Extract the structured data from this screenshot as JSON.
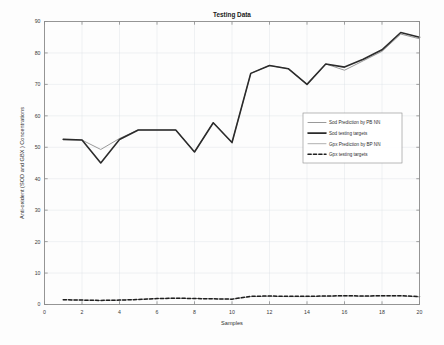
{
  "chart_data": {
    "type": "line",
    "title": "Testing Data",
    "xlabel": "Samples",
    "ylabel": "Anti-oxident (SOD and GBX ) Concentrations",
    "xlim": [
      0,
      20
    ],
    "ylim": [
      0,
      90
    ],
    "xticks": [
      0,
      2,
      4,
      6,
      8,
      10,
      12,
      14,
      16,
      18,
      20
    ],
    "yticks": [
      0,
      10,
      20,
      30,
      40,
      50,
      60,
      70,
      80,
      90
    ],
    "grid": true,
    "legend_position": "center-right",
    "x": [
      1,
      2,
      3,
      4,
      5,
      6,
      7,
      8,
      9,
      10,
      11,
      12,
      13,
      14,
      15,
      16,
      17,
      18,
      19,
      20
    ],
    "series": [
      {
        "name": "Sod Prediction by PB NN",
        "color": "#9a9a9a",
        "style": "solid",
        "width": 1.0,
        "values": [
          52.5,
          52.3,
          49.3,
          52.8,
          55.5,
          55.5,
          55.5,
          48.5,
          57.8,
          51.5,
          73.5,
          76.0,
          75.0,
          70.0,
          76.5,
          74.5,
          77.5,
          80.5,
          86.0,
          84.5
        ]
      },
      {
        "name": "Sod testing targets",
        "color": "#2b2b2b",
        "style": "solid",
        "width": 1.6,
        "values": [
          52.5,
          52.3,
          45.0,
          52.5,
          55.5,
          55.5,
          55.5,
          48.5,
          57.8,
          51.5,
          73.5,
          76.0,
          75.0,
          70.0,
          76.5,
          75.5,
          78.0,
          81.0,
          86.5,
          85.0
        ]
      },
      {
        "name": "Gpx Prediction by BP NN",
        "color": "#a8a8a8",
        "style": "solid",
        "width": 0.9,
        "values": [
          1.5,
          1.4,
          1.3,
          1.4,
          1.6,
          1.9,
          2.0,
          1.9,
          1.8,
          1.7,
          2.5,
          2.6,
          2.5,
          2.5,
          2.6,
          2.7,
          2.6,
          2.7,
          2.7,
          2.4
        ]
      },
      {
        "name": "Gpx testing targets",
        "color": "#1f1f1f",
        "style": "dashed",
        "width": 1.5,
        "values": [
          1.5,
          1.4,
          1.3,
          1.4,
          1.6,
          1.9,
          2.0,
          1.9,
          1.8,
          1.7,
          2.6,
          2.7,
          2.6,
          2.6,
          2.7,
          2.8,
          2.7,
          2.8,
          2.8,
          2.5
        ]
      }
    ]
  },
  "labels": {
    "title": "Testing Data",
    "xlabel": "Samples",
    "ylabel": "Anti-oxident (SOD and GBX ) Concentrations",
    "xticks": [
      "0",
      "2",
      "4",
      "6",
      "8",
      "10",
      "12",
      "14",
      "16",
      "18",
      "20"
    ],
    "yticks": [
      "0",
      "10",
      "20",
      "30",
      "40",
      "50",
      "60",
      "70",
      "80",
      "90"
    ],
    "legend": [
      "Sod Prediction by PB NN",
      "Sod testing targets",
      "Gpx Prediction by BP NN",
      "Gpx testing targets"
    ]
  }
}
